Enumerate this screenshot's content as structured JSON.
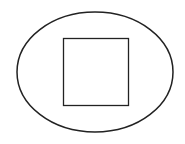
{
  "diagram": {
    "background": "#ffffff",
    "stroke_color": "#222222",
    "shapes": [
      {
        "type": "ellipse",
        "name": "outer-ellipse",
        "cx": 95,
        "cy": 72,
        "rx": 78,
        "ry": 60,
        "stroke_width": 1.5
      },
      {
        "type": "rect",
        "name": "inner-square",
        "x": 63.5,
        "y": 38.5,
        "width": 65,
        "height": 67,
        "stroke_width": 1.3
      }
    ]
  }
}
